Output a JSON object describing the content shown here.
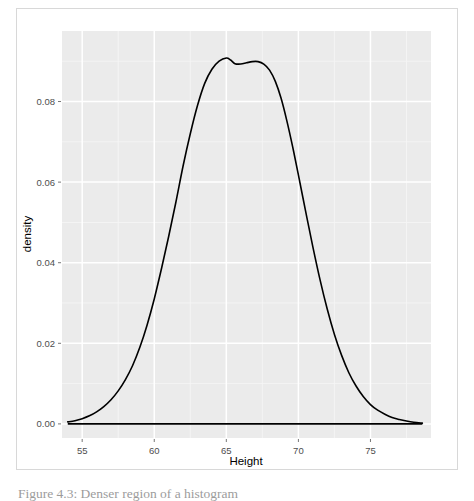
{
  "figure": {
    "caption": "Figure 4.3: Denser region of a histogram",
    "background": "#ffffff",
    "frame_color": "#d8d8d8"
  },
  "chart_data": {
    "type": "line",
    "title": "",
    "subtitle": "",
    "xlabel": "Height",
    "ylabel": "density",
    "xlim": [
      53.6,
      79.2
    ],
    "ylim": [
      -0.0035,
      0.0975
    ],
    "xticks": [
      55,
      60,
      65,
      70,
      75
    ],
    "xticklabels": [
      "55",
      "60",
      "65",
      "70",
      "75"
    ],
    "yticks": [
      0.0,
      0.02,
      0.04,
      0.06,
      0.08
    ],
    "yticklabels": [
      "0.00",
      "0.02",
      "0.04",
      "0.06",
      "0.08"
    ],
    "grid": true,
    "grid_major_color": "#ffffff",
    "grid_minor_color": "#f5f5f5",
    "panel_color": "#ebebeb",
    "legend": null,
    "line_color": "#000000",
    "line_width": 1.6,
    "baseline": {
      "y": 0.0,
      "x_start": 54.0,
      "x_end": 78.6,
      "color": "#000000"
    },
    "series": [
      {
        "name": "density",
        "x": [
          54.0,
          54.5,
          55.0,
          55.5,
          56.0,
          56.5,
          57.0,
          57.5,
          58.0,
          58.5,
          59.0,
          59.5,
          60.0,
          60.5,
          61.0,
          61.5,
          62.0,
          62.5,
          63.0,
          63.5,
          64.0,
          64.5,
          65.0,
          65.3,
          65.6,
          66.0,
          66.4,
          66.8,
          67.2,
          67.6,
          68.0,
          68.4,
          68.8,
          69.2,
          69.6,
          70.0,
          70.5,
          71.0,
          71.5,
          72.0,
          72.5,
          73.0,
          73.5,
          74.0,
          74.5,
          75.0,
          75.5,
          76.0,
          76.5,
          77.0,
          77.5,
          78.0,
          78.6
        ],
        "y": [
          0.0005,
          0.0008,
          0.0013,
          0.002,
          0.003,
          0.0043,
          0.006,
          0.0082,
          0.011,
          0.0145,
          0.019,
          0.0245,
          0.031,
          0.0385,
          0.0465,
          0.055,
          0.064,
          0.072,
          0.079,
          0.0845,
          0.088,
          0.09,
          0.0908,
          0.0903,
          0.0894,
          0.0893,
          0.0896,
          0.0899,
          0.0899,
          0.0893,
          0.0878,
          0.085,
          0.0808,
          0.0752,
          0.0688,
          0.0618,
          0.0528,
          0.044,
          0.0358,
          0.0285,
          0.0222,
          0.017,
          0.0127,
          0.0094,
          0.0068,
          0.0048,
          0.0034,
          0.0024,
          0.0016,
          0.0011,
          0.0007,
          0.0004,
          0.0002
        ]
      }
    ]
  },
  "axes": {
    "y_label": "density",
    "x_label": "Height"
  }
}
